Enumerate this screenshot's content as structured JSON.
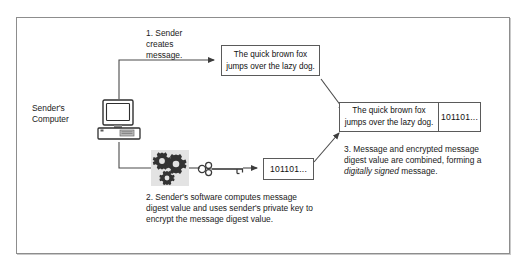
{
  "diagram": {
    "frame": {
      "border_color": "#8d8d8d",
      "background": "#ffffff"
    },
    "nodes": {
      "sender_computer": {
        "label": "Sender's\nComputer",
        "icon": "desktop-computer-icon"
      },
      "message_box": {
        "text": "The quick brown fox jumps over the lazy dog."
      },
      "digest_box": {
        "text": "101101..."
      },
      "signed_box": {
        "message_text": "The quick brown fox jumps over the lazy dog.",
        "digest_text": "101101..."
      },
      "gears": {
        "icon": "gears-icon",
        "count": 3,
        "background": "#e3e3e3"
      },
      "key": {
        "icon": "key-icon",
        "meaning": "sender's private key"
      }
    },
    "steps": [
      {
        "number": "1.",
        "text": "1. Sender\ncreates\nmessage."
      },
      {
        "number": "2.",
        "text": "2. Sender's software computes message digest value and uses sender's private key to encrypt the message digest value."
      },
      {
        "number": "3.",
        "text_before": "3. Message and encrypted message digest value are combined, forming a ",
        "text_emphasis": "digitally signed",
        "text_after": " message."
      }
    ]
  },
  "colors": {
    "line": "#4a4a4a",
    "box_border": "#5a5a5a",
    "text": "#1a1a1a",
    "gear_fill": "#3a3a3a",
    "gear_bg": "#e3e3e3"
  }
}
